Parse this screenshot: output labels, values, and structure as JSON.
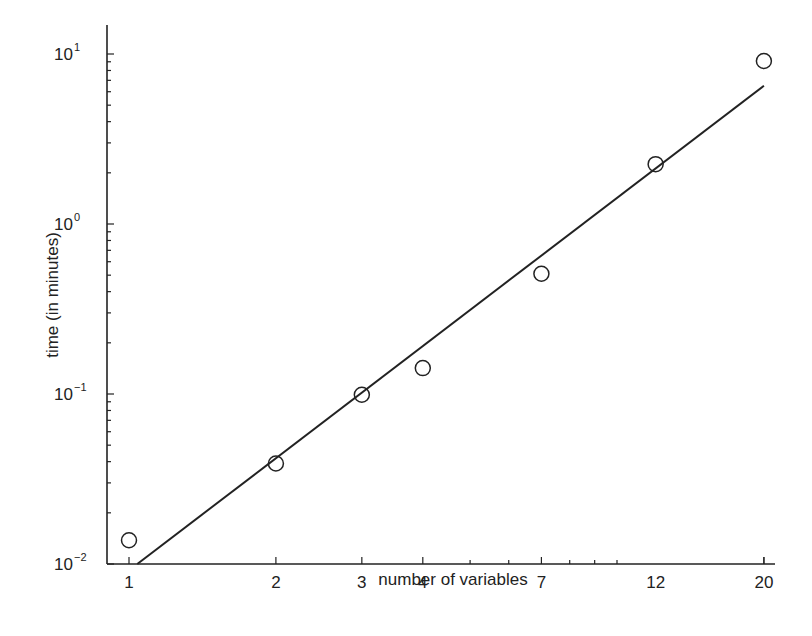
{
  "chart_data": {
    "type": "scatter",
    "title": "",
    "xlabel": "number of variables",
    "ylabel": "time (in minutes)",
    "xscale": "log",
    "yscale": "log",
    "xlim": [
      0.9,
      21.5
    ],
    "ylim": [
      0.01,
      15
    ],
    "grid": false,
    "legend": null,
    "x_ticks": [
      1,
      2,
      3,
      4,
      7,
      12,
      20
    ],
    "x_tick_labels": [
      "1",
      "2",
      "3",
      "4",
      "7",
      "12",
      "20"
    ],
    "y_ticks": [
      0.01,
      0.1,
      1,
      10
    ],
    "y_tick_labels": [
      {
        "base": "10",
        "exp": "-2"
      },
      {
        "base": "10",
        "exp": "-1"
      },
      {
        "base": "10",
        "exp": "0"
      },
      {
        "base": "10",
        "exp": "1"
      }
    ],
    "series": [
      {
        "name": "measured",
        "marker": "open-circle",
        "x": [
          1,
          2,
          3,
          4,
          7,
          12,
          20
        ],
        "y": [
          0.0138,
          0.039,
          0.099,
          0.142,
          0.51,
          2.25,
          9.1
        ]
      },
      {
        "name": "fit",
        "style": "line",
        "x": [
          1.04,
          20
        ],
        "y": [
          0.01,
          6.5
        ]
      }
    ]
  },
  "labels": {
    "xlabel": "number of variables",
    "ylabel": "time (in minutes)"
  }
}
